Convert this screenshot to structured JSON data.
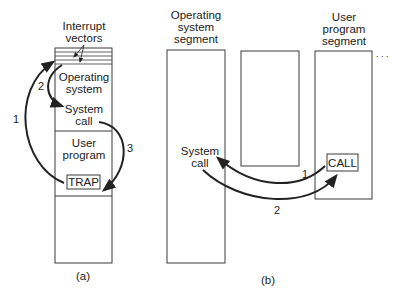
{
  "figure_a": {
    "caption": "(a)",
    "header_line1": "Interrupt",
    "header_line2": "vectors",
    "os_line1": "Operating",
    "os_line2": "system",
    "syscall_line1": "System",
    "syscall_line2": "call",
    "user_line1": "User",
    "user_line2": "program",
    "trap_label": "TRAP",
    "arrow_labels": [
      "1",
      "2",
      "3"
    ]
  },
  "figure_b": {
    "caption": "(b)",
    "os_segment_line1": "Operating",
    "os_segment_line2": "system",
    "os_segment_line3": "segment",
    "user_segment_line1": "User",
    "user_segment_line2": "program",
    "user_segment_line3": "segment",
    "syscall_line1": "System",
    "syscall_line2": "call",
    "call_label": "CALL",
    "ellipsis": ". . .",
    "arrow_labels": [
      "1",
      "2"
    ]
  },
  "colors": {
    "stroke": "#3a3a3a",
    "text": "#222222",
    "background": "#ffffff"
  }
}
